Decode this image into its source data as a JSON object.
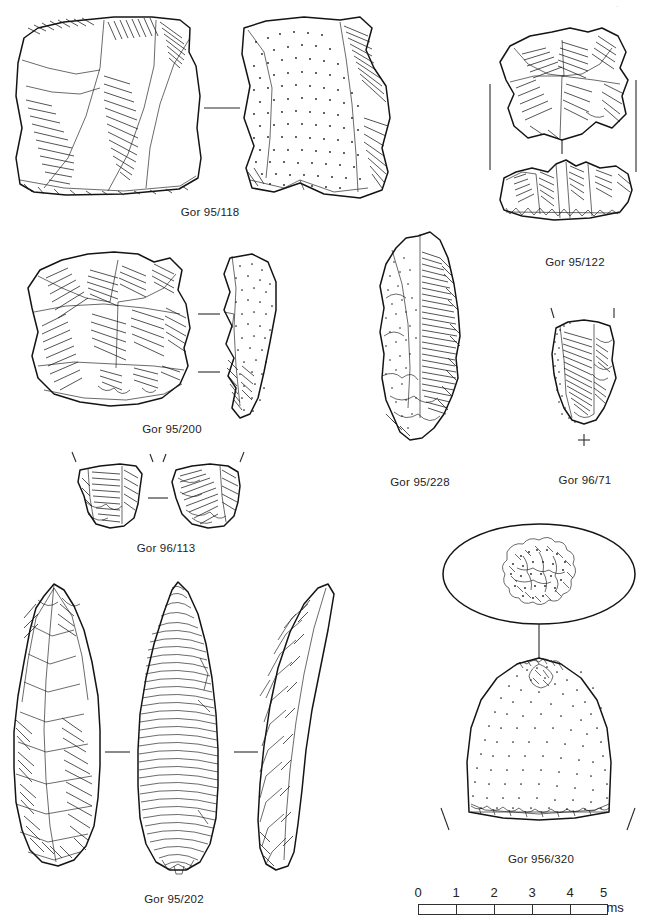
{
  "plate": {
    "type": "archaeological-lithic-illustration-plate",
    "background_color": "#ffffff",
    "ink_color": "#1b1b1b",
    "width": 661,
    "height": 919,
    "corner_mark": "·"
  },
  "artifacts": [
    {
      "id": "gor-95-118",
      "label": "Gor 95/118",
      "views": 2,
      "description": "Large flake / core face, two views joined by a horizontal orientation rule; right view stippled cortex surface",
      "caption_x": 210,
      "caption_y": 208
    },
    {
      "id": "gor-95-122",
      "label": "Gor 95/122",
      "views": 2,
      "description": "Discoidal core, plan and profile views with vertical orientation rules",
      "caption_x": 575,
      "caption_y": 258
    },
    {
      "id": "gor-95-200",
      "label": "Gor 95/200",
      "views": 2,
      "description": "Levallois core with plan view and stippled profile section, two orientation rules",
      "caption_x": 172,
      "caption_y": 425
    },
    {
      "id": "gor-95-228",
      "label": "Gor 95/228",
      "views": 1,
      "description": "Elongated blade-like flake with heavy parallel hatching and stipple",
      "caption_x": 419,
      "caption_y": 478
    },
    {
      "id": "gor-96-71",
      "label": "Gor 96/71",
      "views": 1,
      "description": "Short flake fragment with cortical margin, vertical tick marks above and a plus sign below",
      "caption_x": 585,
      "caption_y": 476,
      "annotation": "+",
      "annotation_x": 586,
      "annotation_y": 452
    },
    {
      "id": "gor-96-113",
      "label": "Gor 96/113",
      "views": 2,
      "description": "Two small flake fragments side by side with tick marks, joined by a short horizontal rule",
      "caption_x": 166,
      "caption_y": 544
    },
    {
      "id": "gor-95-202",
      "label": "Gor 95/202",
      "views": 3,
      "description": "Large bifacial leaf point, three views: dorsal face, ventral face with fine ripple hatching, and lateral profile",
      "caption_x": 174,
      "caption_y": 895
    },
    {
      "id": "gor-956-320",
      "label": "Gor 956/320",
      "views": 2,
      "description": "Pounder / hammerstone, oval top view above and stippled dome-shaped side view with battered base",
      "caption_x": 541,
      "caption_y": 855
    }
  ],
  "scale_bar": {
    "name": "scale-bar",
    "x": 418,
    "y": 885,
    "width": 190,
    "units_label": "5 cms",
    "ticks": [
      "0",
      "1",
      "2",
      "3",
      "4"
    ],
    "last_tick_value": "5",
    "divisions": 5,
    "bar_color": "#ffffff",
    "line_color": "#303030"
  }
}
